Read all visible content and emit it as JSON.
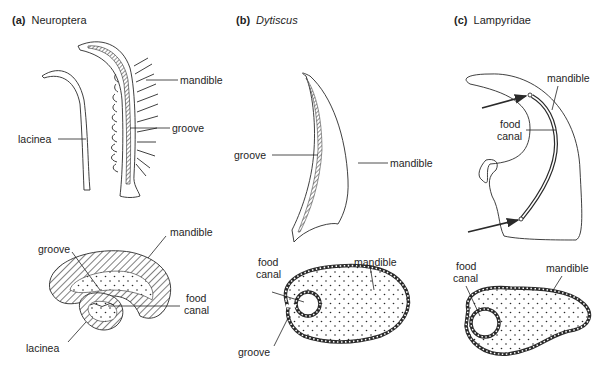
{
  "figure": {
    "panels": [
      {
        "id": "a",
        "letter": "(a)",
        "taxon": "Neuroptera",
        "italic": false,
        "top_labels": [
          "mandible",
          "groove",
          "lacinea"
        ],
        "bottom_labels": [
          "groove",
          "mandible",
          "food",
          "canal",
          "lacinea"
        ]
      },
      {
        "id": "b",
        "letter": "(b)",
        "taxon": "Dytiscus",
        "italic": true,
        "top_labels": [
          "groove",
          "mandible"
        ],
        "bottom_labels": [
          "food",
          "canal",
          "mandible",
          "groove"
        ]
      },
      {
        "id": "c",
        "letter": "(c)",
        "taxon": "Lampyridae",
        "italic": false,
        "top_labels": [
          "mandible",
          "food",
          "canal"
        ],
        "bottom_labels": [
          "food",
          "canal",
          "mandible"
        ]
      }
    ]
  },
  "colors": {
    "ink": "#2a2a2a",
    "background": "#ffffff"
  }
}
